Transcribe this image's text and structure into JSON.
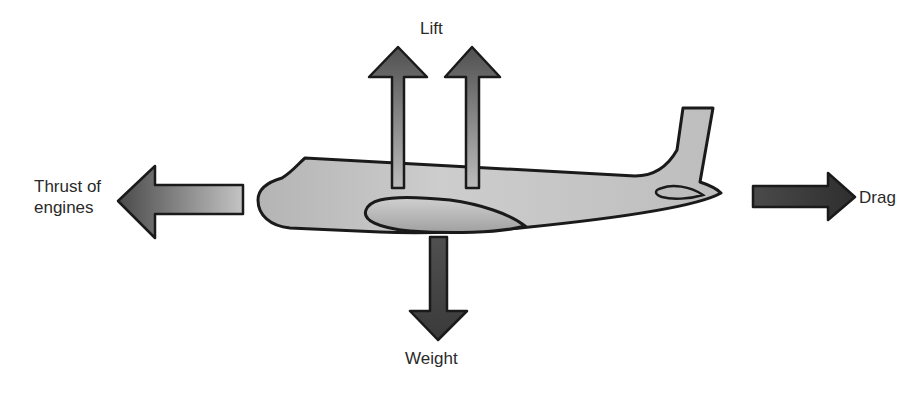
{
  "diagram": {
    "colors": {
      "outline": "#1a1a1a",
      "aircraft_fill_light": "#c6c6c6",
      "aircraft_fill_dark": "#9a9a9a",
      "arrow_fill_light": "#a8a8a8",
      "arrow_fill_dark": "#3a3a3a",
      "text": "#2a2a2a"
    },
    "nodes": [
      {
        "id": "aircraft",
        "label": "",
        "shape": "airplane-silhouette"
      }
    ],
    "forces": [
      {
        "id": "lift",
        "label": "Lift",
        "direction": "up",
        "count": 2
      },
      {
        "id": "thrust",
        "label_line1": "Thrust of",
        "label_line2": "engines",
        "direction": "left"
      },
      {
        "id": "drag",
        "label": "Drag",
        "direction": "right"
      },
      {
        "id": "weight",
        "label": "Weight",
        "direction": "down"
      }
    ]
  }
}
